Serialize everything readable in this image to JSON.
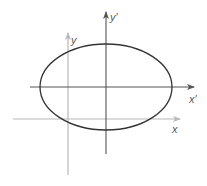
{
  "diagram": {
    "type": "coordinate-translation-ellipse",
    "labels": {
      "y_prime": "y′",
      "x_prime": "x′",
      "y": "y",
      "x": "x"
    },
    "colors": {
      "ellipse": "#333333",
      "primed_axes": "#555555",
      "original_axes": "#b8b8b8",
      "label": "#5a5a5a"
    },
    "ellipse": {
      "cx": 106,
      "cy": 87,
      "rx": 66,
      "ry": 43
    },
    "primed_axes": {
      "x_prime": {
        "x1": 30,
        "y": 87,
        "x2": 194
      },
      "y_prime": {
        "x": 106,
        "y1": 154,
        "y2": 12
      }
    },
    "original_axes": {
      "x": {
        "x1": 13,
        "y": 119,
        "x2": 180
      },
      "y": {
        "x": 68,
        "y1": 175,
        "y2": 33
      }
    }
  }
}
